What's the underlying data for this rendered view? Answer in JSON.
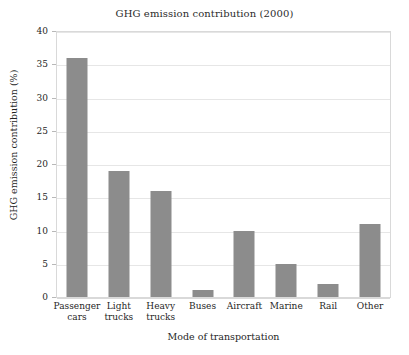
{
  "chart_data": {
    "type": "bar",
    "title": "GHG emission contribution (2000)",
    "xlabel": "Mode of transportation",
    "ylabel": "GHG emission contribution (%)",
    "categories": [
      "Passenger cars",
      "Light trucks",
      "Heavy trucks",
      "Buses",
      "Aircraft",
      "Marine",
      "Rail",
      "Other"
    ],
    "category_lines": [
      [
        "Passenger",
        "cars"
      ],
      [
        "Light",
        "trucks"
      ],
      [
        "Heavy",
        "trucks"
      ],
      [
        "Buses",
        ""
      ],
      [
        "Aircraft",
        ""
      ],
      [
        "Marine",
        ""
      ],
      [
        "Rail",
        ""
      ],
      [
        "Other",
        ""
      ]
    ],
    "values": [
      36,
      19,
      16,
      1,
      10,
      5,
      2,
      11
    ],
    "ylim": [
      0,
      40
    ],
    "yticks": [
      0,
      5,
      10,
      15,
      20,
      25,
      30,
      35,
      40
    ],
    "grid": true,
    "legend": "none",
    "bar_color": "#8c8c8c",
    "grid_color": "#e6e6e6",
    "frame_color": "#d9d9d9"
  }
}
